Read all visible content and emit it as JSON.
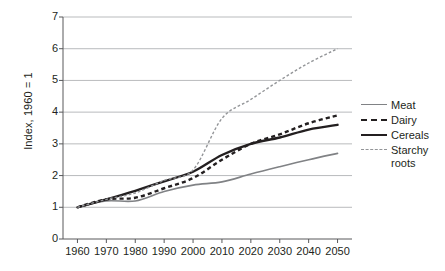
{
  "chart_data": {
    "type": "line",
    "title": "",
    "xlabel": "",
    "ylabel": "Index, 1960 = 1",
    "x": [
      1960,
      1970,
      1980,
      1990,
      2000,
      2010,
      2020,
      2030,
      2040,
      2050
    ],
    "xlim": [
      1955,
      2055
    ],
    "ylim": [
      0,
      7
    ],
    "yticks": [
      0,
      1,
      2,
      3,
      4,
      5,
      6,
      7
    ],
    "xticks": [
      1960,
      1970,
      1980,
      1990,
      2000,
      2010,
      2020,
      2030,
      2040,
      2050
    ],
    "xtick_labels": [
      "1960",
      "1970",
      "1980",
      "1990",
      "2000",
      "2010",
      "2020",
      "2030",
      "2040",
      "2050"
    ],
    "ytick_labels": [
      "0",
      "1",
      "2",
      "3",
      "4",
      "5",
      "6",
      "7"
    ],
    "grid": "horizontal",
    "legend_position": "right",
    "series": [
      {
        "name": "Meat",
        "label": "Meat",
        "color": "#808285",
        "style": "solid",
        "width": 1.6,
        "values": [
          1.0,
          1.2,
          1.2,
          1.5,
          1.7,
          1.8,
          2.05,
          2.28,
          2.5,
          2.7
        ]
      },
      {
        "name": "Dairy",
        "label": "Dairy",
        "color": "#231f20",
        "style": "dashed",
        "width": 2.4,
        "values": [
          1.0,
          1.25,
          1.3,
          1.6,
          1.92,
          2.5,
          3.0,
          3.3,
          3.65,
          3.9
        ]
      },
      {
        "name": "Cereals",
        "label": "Cereals",
        "color": "#231f20",
        "style": "solid",
        "width": 2.4,
        "values": [
          1.0,
          1.25,
          1.52,
          1.82,
          2.12,
          2.65,
          3.0,
          3.2,
          3.45,
          3.6
        ]
      },
      {
        "name": "Starchy roots",
        "label": "Starchy\nroots",
        "color": "#939598",
        "style": "dotted",
        "width": 1.4,
        "values": [
          1.0,
          1.25,
          1.45,
          1.85,
          2.18,
          3.8,
          4.4,
          5.0,
          5.55,
          6.0
        ]
      }
    ]
  },
  "axes": {
    "y_title": "Index, 1960 = 1"
  },
  "legend": {
    "items": [
      {
        "label": "Meat"
      },
      {
        "label": "Dairy"
      },
      {
        "label": "Cereals"
      },
      {
        "label": "Starchy\nroots"
      }
    ]
  }
}
